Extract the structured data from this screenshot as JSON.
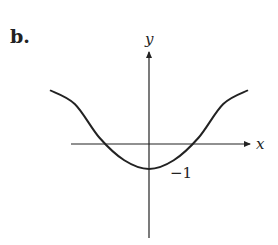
{
  "chart_data": {
    "type": "line",
    "panel_label": "b.",
    "title": "",
    "xlabel": "x",
    "ylabel": "y",
    "annotations": [
      {
        "text": "−1",
        "near": "curve minimum, right of y-axis"
      }
    ],
    "series": [
      {
        "name": "curve",
        "description": "bell-inverted curve: horizontal asymptote-like shoulders above x-axis on both sides, crosses x-axis twice, minimum at y = -1 on the y-axis",
        "x": [
          -2.0,
          -1.5,
          -1.0,
          -0.5,
          0.0,
          0.5,
          1.0,
          1.5,
          2.0
        ],
        "y": [
          2.15,
          1.6,
          0.25,
          -0.65,
          -1.0,
          -0.65,
          0.25,
          1.6,
          2.15
        ]
      }
    ],
    "xlim": [
      -2.0,
      2.0
    ],
    "ylim": [
      -3.5,
      3.6
    ],
    "x_zero_crossings": [
      -0.9,
      0.9
    ],
    "minimum": {
      "x": 0,
      "y": -1
    },
    "grid": false,
    "legend": "none"
  }
}
